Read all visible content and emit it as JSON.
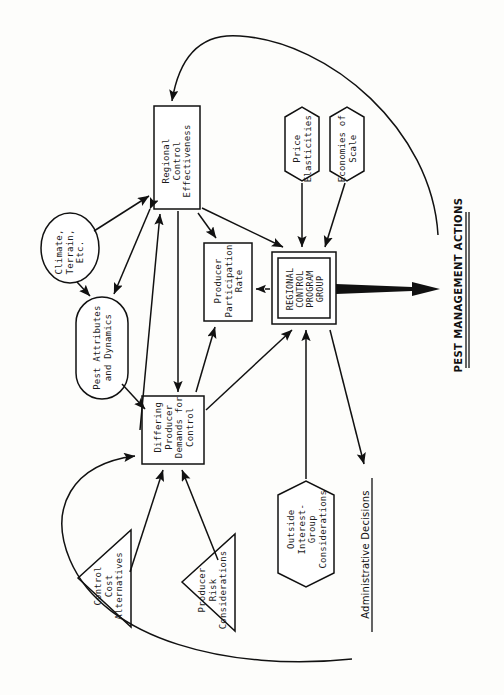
{
  "diagram": {
    "orientation": "rotated-90-ccw",
    "ink_color": "#111111",
    "paper_color": "#fdfdfb"
  },
  "nodes": {
    "regional_control_effectiveness": {
      "label": "Regional\nControl\nEffectiveness",
      "shape": "rectangle",
      "x": 177,
      "y": 157,
      "w": 46,
      "h": 103
    },
    "climate_terrain": {
      "label": "Climate,\nTerrain,\nEtc.",
      "shape": "ellipse",
      "x": 70,
      "y": 248,
      "w": 58,
      "h": 70
    },
    "pest_attributes": {
      "label": "Pest Attributes\nand Dynamics",
      "shape": "stadium",
      "x": 102,
      "y": 348,
      "w": 52,
      "h": 102
    },
    "differing_producer_demands": {
      "label": "Differing\nProducer\nDemands for\nControl",
      "shape": "rectangle",
      "x": 173,
      "y": 430,
      "w": 62,
      "h": 68
    },
    "producer_participation_rate": {
      "label": "Producer\nParticipation\nRate",
      "shape": "rectangle",
      "x": 228,
      "y": 282,
      "w": 48,
      "h": 78
    },
    "regional_control_program_group": {
      "label": "REGIONAL\nCONTROL\nPROGRAM\nGROUP",
      "shape": "double-rectangle",
      "x": 304,
      "y": 288,
      "w": 64,
      "h": 72
    },
    "price_elasticities": {
      "label": "Price\nElasticities",
      "shape": "hexagon",
      "x": 302,
      "y": 144,
      "w": 34,
      "h": 74
    },
    "economies_of_scale": {
      "label": "Economies of\nScale",
      "shape": "hexagon",
      "x": 347,
      "y": 144,
      "w": 34,
      "h": 74
    },
    "outside_interest_group": {
      "label": "Outside\nInterest-\nGroup\nConsiderations",
      "shape": "hexagon",
      "x": 306,
      "y": 527,
      "w": 56,
      "h": 92
    },
    "control_cost_alternatives": {
      "label": "Control\nCost\nAlternatives",
      "shape": "triangle",
      "x": 104,
      "y": 578,
      "w": 52,
      "h": 98
    },
    "producer_risk_considerations": {
      "label": "Producer\nRisk\nConsiderations",
      "shape": "triangle",
      "x": 208,
      "y": 582,
      "w": 52,
      "h": 98
    }
  },
  "labels": {
    "pest_management_actions": {
      "text": "PEST MANAGEMENT ACTIONS",
      "underline": "double",
      "x": 455,
      "y": 290
    },
    "administrative_decisions": {
      "text": "Administrative Decisions",
      "underline": "single",
      "x": 362,
      "y": 550
    }
  },
  "edges": [
    {
      "from": "climate_terrain",
      "to": "regional_control_effectiveness",
      "style": "solid"
    },
    {
      "from": "climate_terrain",
      "to": "pest_attributes",
      "style": "solid"
    },
    {
      "from": "regional_control_effectiveness",
      "to": "pest_attributes",
      "style": "solid",
      "bidirectional": true
    },
    {
      "from": "pest_attributes",
      "to": "differing_producer_demands",
      "style": "solid"
    },
    {
      "from": "differing_producer_demands",
      "to": "regional_control_effectiveness",
      "style": "solid"
    },
    {
      "from": "regional_control_effectiveness",
      "to": "differing_producer_demands",
      "style": "solid"
    },
    {
      "from": "differing_producer_demands",
      "to": "producer_participation_rate",
      "style": "solid"
    },
    {
      "from": "regional_control_effectiveness",
      "to": "producer_participation_rate",
      "style": "solid"
    },
    {
      "from": "regional_control_effectiveness",
      "to": "regional_control_program_group",
      "style": "solid"
    },
    {
      "from": "price_elasticities",
      "to": "regional_control_program_group",
      "style": "solid"
    },
    {
      "from": "economies_of_scale",
      "to": "regional_control_program_group",
      "style": "solid"
    },
    {
      "from": "regional_control_program_group",
      "to": "producer_participation_rate",
      "style": "dashed"
    },
    {
      "from": "differing_producer_demands",
      "to": "regional_control_program_group",
      "style": "solid"
    },
    {
      "from": "outside_interest_group",
      "to": "regional_control_program_group",
      "style": "solid"
    },
    {
      "from": "regional_control_program_group",
      "to": "administrative_decisions",
      "style": "solid"
    },
    {
      "from": "regional_control_program_group",
      "to": "pest_management_actions",
      "style": "thick-arrow"
    },
    {
      "from": "control_cost_alternatives",
      "to": "differing_producer_demands",
      "style": "solid"
    },
    {
      "from": "producer_risk_considerations",
      "to": "differing_producer_demands",
      "style": "solid"
    },
    {
      "from": "pest_management_actions",
      "to": "regional_control_effectiveness",
      "style": "curve"
    },
    {
      "from": "administrative_decisions",
      "to": "differing_producer_demands",
      "style": "curve"
    }
  ]
}
